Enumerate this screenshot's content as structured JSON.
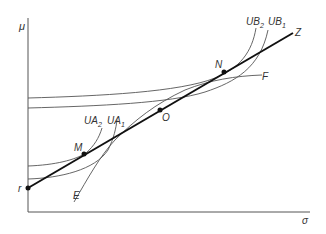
{
  "diagram": {
    "axes": {
      "y_label": "μ",
      "x_label": "σ"
    },
    "points": {
      "r": "r",
      "M": "M",
      "O": "O",
      "N": "N"
    },
    "lines": {
      "capital_market_line_end": "Z",
      "efficient_frontier_low": "E",
      "efficient_frontier_high": "F"
    },
    "indifference_curves": {
      "UA1": {
        "base": "UA",
        "sub": "1"
      },
      "UA2": {
        "base": "UA",
        "sub": "2"
      },
      "UB1": {
        "base": "UB",
        "sub": "1"
      },
      "UB2": {
        "base": "UB",
        "sub": "2"
      }
    },
    "colors": {
      "line": "#111111",
      "curve": "#555555",
      "text": "#333333"
    }
  }
}
